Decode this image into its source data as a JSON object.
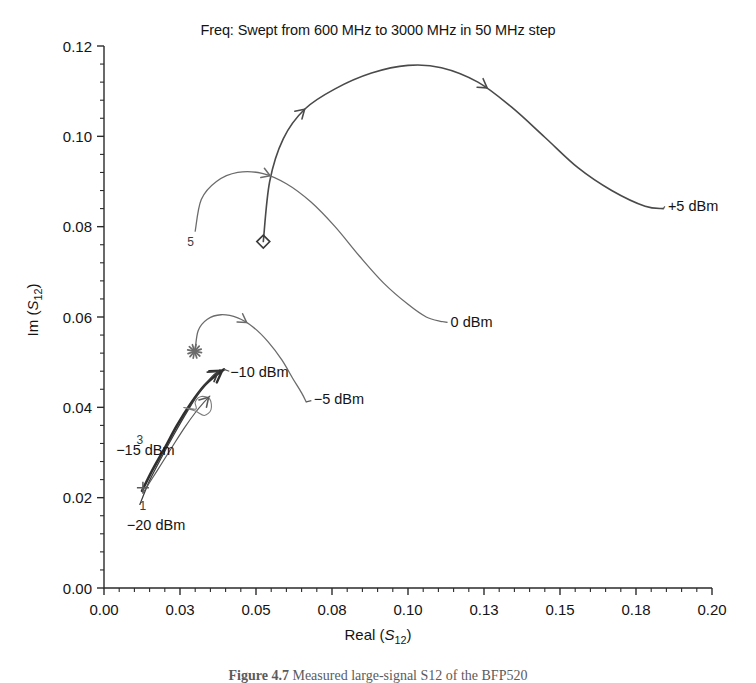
{
  "figure": {
    "title": "Freq: Swept from 600 MHz to 3000 MHz in 50 MHz step",
    "caption_prefix": "Figure 4.7",
    "caption_text": "Measured large-signal S12 of the BFP520",
    "axis_color": "#2b2b2b",
    "background": "#ffffff"
  },
  "chart_data": {
    "type": "line",
    "title": "Freq: Swept from 600 MHz to 3000 MHz in 50 MHz step",
    "xlabel": "Real (S12)",
    "ylabel": "Im (S12)",
    "xlim": [
      0.0,
      0.2
    ],
    "ylim": [
      0.0,
      0.12
    ],
    "xticks": [
      0.0,
      0.03,
      0.05,
      0.08,
      0.1,
      0.13,
      0.15,
      0.18,
      0.2
    ],
    "xtick_labels": [
      "0.00",
      "0.03",
      "0.05",
      "0.08",
      "0.10",
      "0.13",
      "0.15",
      "0.18",
      "0.20"
    ],
    "yticks": [
      0.0,
      0.02,
      0.04,
      0.06,
      0.08,
      0.1,
      0.12
    ],
    "ytick_labels": [
      "0.00",
      "0.02",
      "0.04",
      "0.06",
      "0.08",
      "0.10",
      "0.12"
    ],
    "minor_ticks_per_interval": 4,
    "grid": false,
    "legend": "inline-annotations",
    "sweep": {
      "start_freq": "600 MHz",
      "stop_freq": "3000 MHz",
      "step": "50 MHz"
    },
    "series": [
      {
        "name": "+5 dBm",
        "label": "+5 dBm",
        "color": "#4a4a4a",
        "width": 1.6,
        "start_marker": "diamond",
        "points": [
          [
            0.0524,
            0.0767
          ],
          [
            0.0545,
            0.09
          ],
          [
            0.059,
            0.0995
          ],
          [
            0.066,
            0.106
          ],
          [
            0.076,
            0.1105
          ],
          [
            0.088,
            0.114
          ],
          [
            0.1,
            0.1157
          ],
          [
            0.111,
            0.1152
          ],
          [
            0.123,
            0.112
          ],
          [
            0.134,
            0.1065
          ],
          [
            0.145,
            0.0998
          ],
          [
            0.156,
            0.093
          ],
          [
            0.167,
            0.088
          ],
          [
            0.178,
            0.0845
          ],
          [
            0.184,
            0.084
          ]
        ]
      },
      {
        "name": "0 dBm",
        "label": "0 dBm",
        "color": "#6b6b6b",
        "width": 1.3,
        "start_marker": "5",
        "points": [
          [
            0.03,
            0.079
          ],
          [
            0.032,
            0.086
          ],
          [
            0.037,
            0.09
          ],
          [
            0.044,
            0.092
          ],
          [
            0.052,
            0.0918
          ],
          [
            0.06,
            0.0895
          ],
          [
            0.068,
            0.0855
          ],
          [
            0.076,
            0.08
          ],
          [
            0.084,
            0.0735
          ],
          [
            0.092,
            0.0675
          ],
          [
            0.1,
            0.0628
          ],
          [
            0.106,
            0.06
          ],
          [
            0.111,
            0.059
          ]
        ]
      },
      {
        "name": "-5 dBm",
        "label": "−5 dBm",
        "color": "#6b6b6b",
        "width": 1.3,
        "start_marker": "asterisk",
        "points": [
          [
            0.03,
            0.0528
          ],
          [
            0.031,
            0.057
          ],
          [
            0.034,
            0.0595
          ],
          [
            0.0385,
            0.0605
          ],
          [
            0.044,
            0.0598
          ],
          [
            0.049,
            0.0578
          ],
          [
            0.054,
            0.0545
          ],
          [
            0.0585,
            0.0505
          ],
          [
            0.062,
            0.0465
          ],
          [
            0.065,
            0.0432
          ],
          [
            0.0665,
            0.0412
          ]
        ]
      },
      {
        "name": "-10 dBm",
        "label": "−10 dBm",
        "color": "#2f2f2f",
        "width": 2.6,
        "start_marker": "none",
        "points": [
          [
            0.0125,
            0.0215
          ],
          [
            0.016,
            0.0262
          ],
          [
            0.02,
            0.031
          ],
          [
            0.024,
            0.036
          ],
          [
            0.0285,
            0.0408
          ],
          [
            0.033,
            0.0448
          ],
          [
            0.037,
            0.0472
          ],
          [
            0.0395,
            0.0484
          ]
        ]
      },
      {
        "name": "-15 dBm",
        "label": "−15 dBm",
        "color": "#3a3a3a",
        "width": 1.3,
        "start_marker": "3",
        "points": [
          [
            0.0118,
            0.0185
          ],
          [
            0.015,
            0.0238
          ],
          [
            0.019,
            0.029
          ],
          [
            0.0232,
            0.0342
          ],
          [
            0.0275,
            0.0392
          ],
          [
            0.0318,
            0.0438
          ],
          [
            0.0355,
            0.0468
          ],
          [
            0.0382,
            0.0483
          ]
        ]
      },
      {
        "name": "-20 dBm",
        "label": "−20 dBm",
        "color": "#5a5a5a",
        "width": 1.2,
        "start_marker": "plus",
        "points": [
          [
            0.013,
            0.0212
          ],
          [
            0.0175,
            0.026
          ],
          [
            0.0222,
            0.031
          ],
          [
            0.0265,
            0.0355
          ],
          [
            0.03,
            0.0388
          ],
          [
            0.033,
            0.0412
          ],
          [
            0.0348,
            0.0425
          ]
        ]
      },
      {
        "name": "small-loop",
        "label": "",
        "color": "#7a7a7a",
        "width": 1.1,
        "start_marker": "none",
        "points": [
          [
            0.0262,
            0.04
          ],
          [
            0.03,
            0.0392
          ],
          [
            0.033,
            0.0382
          ],
          [
            0.0352,
            0.0395
          ],
          [
            0.0348,
            0.0418
          ],
          [
            0.032,
            0.0424
          ],
          [
            0.03,
            0.0412
          ],
          [
            0.0302,
            0.0396
          ]
        ]
      }
    ],
    "markers": [
      {
        "symbol": "5",
        "x": 0.0285,
        "y": 0.0768,
        "kind": "text"
      },
      {
        "symbol": "diamond",
        "x": 0.0524,
        "y": 0.0767,
        "kind": "glyph"
      },
      {
        "symbol": "asterisk",
        "x": 0.0298,
        "y": 0.0524,
        "kind": "glyph"
      },
      {
        "symbol": "3",
        "x": 0.0118,
        "y": 0.033,
        "kind": "text"
      },
      {
        "symbol": "+",
        "x": 0.0128,
        "y": 0.0222,
        "kind": "glyph"
      },
      {
        "symbol": "1",
        "x": 0.0128,
        "y": 0.0184,
        "kind": "text"
      }
    ],
    "annotations": [
      {
        "text": "+5 dBm",
        "x": 0.1855,
        "y": 0.0845
      },
      {
        "text": "0 dBm",
        "x": 0.114,
        "y": 0.059
      },
      {
        "text": "−5 dBm",
        "x": 0.069,
        "y": 0.0418
      },
      {
        "text": "−10 dBm",
        "x": 0.0415,
        "y": 0.0478
      },
      {
        "text": "−15 dBm",
        "x": 0.004,
        "y": 0.0305
      },
      {
        "text": "−20 dBm",
        "x": 0.0075,
        "y": 0.014
      }
    ]
  }
}
